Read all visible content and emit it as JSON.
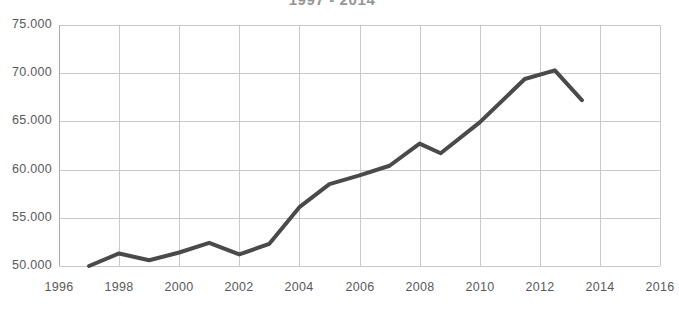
{
  "chart_data": {
    "type": "line",
    "title": "1997 - 2014",
    "xlabel": "",
    "ylabel": "",
    "grid": true,
    "legend": false,
    "line_color": "#4a4a4a",
    "grid_color": "#c9c9c9",
    "axis_color": "#a8a8a8",
    "tick_label_color": "#59595c",
    "xlim": [
      1996,
      2016
    ],
    "ylim": [
      50000,
      75000
    ],
    "xticks": [
      1996,
      1998,
      2000,
      2002,
      2004,
      2006,
      2008,
      2010,
      2012,
      2014,
      2016
    ],
    "xtick_labels": [
      "1996",
      "1998",
      "2000",
      "2002",
      "2004",
      "2006",
      "2008",
      "2010",
      "2012",
      "2014",
      "2016"
    ],
    "yticks": [
      50000,
      55000,
      60000,
      65000,
      70000,
      75000
    ],
    "ytick_labels": [
      "50.000",
      "55.000",
      "60.000",
      "65.000",
      "70.000",
      "75.000"
    ],
    "series": [
      {
        "name": "series-1",
        "x": [
          1997.0,
          1998.0,
          1999.0,
          2000.0,
          2001.0,
          2002.0,
          2003.0,
          2004.0,
          2005.0,
          2006.0,
          2007.0,
          2008.0,
          2008.7,
          2010.0,
          2011.5,
          2012.5,
          2013.4
        ],
        "values": [
          50000,
          51300,
          50600,
          51400,
          52400,
          51200,
          52300,
          56100,
          58500,
          59400,
          60400,
          62700,
          61700,
          64900,
          69400,
          70300,
          67200
        ]
      }
    ]
  }
}
